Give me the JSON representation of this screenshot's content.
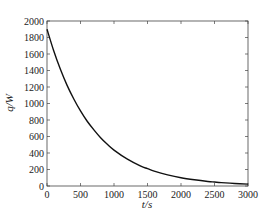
{
  "chart_data": {
    "type": "line",
    "title": "",
    "xlabel": "t/s",
    "ylabel": "q/W",
    "xlim": [
      0,
      3000
    ],
    "ylim": [
      0,
      2000
    ],
    "x_ticks": [
      0,
      500,
      1000,
      1500,
      2000,
      2500,
      3000
    ],
    "y_ticks": [
      0,
      200,
      400,
      600,
      800,
      1000,
      1200,
      1400,
      1600,
      1800,
      2000
    ],
    "grid": false,
    "legend": null,
    "series": [
      {
        "name": "q",
        "color": "#111111",
        "x": [
          0,
          100,
          200,
          300,
          400,
          500,
          600,
          700,
          800,
          900,
          1000,
          1200,
          1400,
          1500,
          1600,
          1800,
          2000,
          2200,
          2400,
          2500,
          2600,
          2800,
          3000
        ],
        "y": [
          1900,
          1640,
          1415,
          1220,
          1055,
          910,
          785,
          680,
          585,
          505,
          435,
          325,
          240,
          210,
          180,
          135,
          100,
          75,
          55,
          48,
          41,
          31,
          23
        ]
      }
    ]
  }
}
